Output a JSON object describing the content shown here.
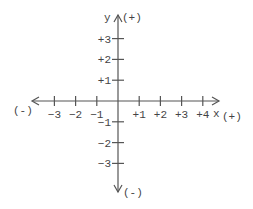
{
  "diagram": {
    "type": "coordinate-axes",
    "x_axis": {
      "name": "x",
      "positive_label": "(+)",
      "negative_label": "(-)",
      "ticks": [
        {
          "value": -3,
          "label": "−3"
        },
        {
          "value": -2,
          "label": "−2"
        },
        {
          "value": -1,
          "label": "−1"
        },
        {
          "value": 1,
          "label": "+1"
        },
        {
          "value": 2,
          "label": "+2"
        },
        {
          "value": 3,
          "label": "+3"
        },
        {
          "value": 4,
          "label": "+4"
        }
      ]
    },
    "y_axis": {
      "name": "y",
      "positive_label": "(+)",
      "negative_label": "(-)",
      "ticks": [
        {
          "value": 3,
          "label": "+3"
        },
        {
          "value": 2,
          "label": "+2"
        },
        {
          "value": 1,
          "label": "+1"
        },
        {
          "value": -1,
          "label": "−1"
        },
        {
          "value": -2,
          "label": "−2"
        },
        {
          "value": -3,
          "label": "−3"
        }
      ]
    }
  }
}
